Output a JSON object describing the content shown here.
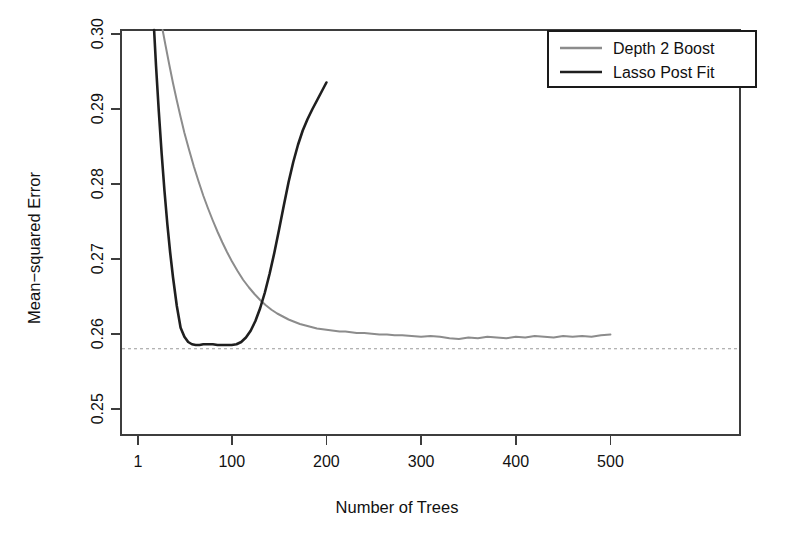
{
  "chart_data": {
    "type": "line",
    "title": "",
    "xlabel": "Number of Trees",
    "ylabel": "Mean−squared Error",
    "xlim": [
      1,
      500
    ],
    "ylim": [
      0.2465,
      0.3005
    ],
    "xticks": [
      1,
      100,
      200,
      300,
      400,
      500
    ],
    "xticklabels": [
      "1",
      "100",
      "200",
      "300",
      "400",
      "500"
    ],
    "yticks": [
      0.25,
      0.26,
      0.27,
      0.28,
      0.29,
      0.3
    ],
    "yticklabels": [
      "0.25",
      "0.26",
      "0.27",
      "0.28",
      "0.29",
      "0.30"
    ],
    "grid": false,
    "legend_position": "top-right",
    "annotations": [
      {
        "name": "reference-line",
        "type": "hline",
        "value": 0.258,
        "style": "dashed",
        "color": "#9a9a9a"
      }
    ],
    "series": [
      {
        "name": "Depth 2 Boost",
        "color": "#8c8c8c",
        "width": 2.0,
        "x": [
          27,
          30,
          34,
          38,
          42,
          46,
          50,
          55,
          60,
          65,
          70,
          75,
          80,
          85,
          90,
          95,
          100,
          106,
          112,
          118,
          124,
          130,
          136,
          142,
          148,
          154,
          160,
          166,
          172,
          178,
          184,
          190,
          196,
          202,
          208,
          214,
          220,
          226,
          232,
          240,
          248,
          256,
          264,
          272,
          280,
          290,
          300,
          310,
          320,
          330,
          340,
          350,
          360,
          370,
          380,
          390,
          400,
          410,
          420,
          430,
          440,
          450,
          460,
          470,
          480,
          490,
          500
        ],
        "y": [
          0.3005,
          0.2985,
          0.2959,
          0.2934,
          0.2911,
          0.2889,
          0.2868,
          0.2845,
          0.2823,
          0.2803,
          0.2784,
          0.2767,
          0.2751,
          0.2736,
          0.2722,
          0.2709,
          0.2697,
          0.2684,
          0.2672,
          0.2662,
          0.2653,
          0.2645,
          0.2638,
          0.2632,
          0.2627,
          0.2623,
          0.2619,
          0.2616,
          0.2613,
          0.2611,
          0.2609,
          0.2607,
          0.2606,
          0.2605,
          0.2604,
          0.2603,
          0.2603,
          0.2602,
          0.2601,
          0.2601,
          0.26,
          0.2599,
          0.2599,
          0.2598,
          0.2598,
          0.2597,
          0.2596,
          0.2597,
          0.2596,
          0.2594,
          0.2593,
          0.2595,
          0.2594,
          0.2596,
          0.2595,
          0.2594,
          0.2596,
          0.2595,
          0.2597,
          0.2596,
          0.2595,
          0.2597,
          0.2596,
          0.2597,
          0.2596,
          0.2598,
          0.2599
        ]
      },
      {
        "name": "Lasso Post Fit",
        "color": "#1f1f1f",
        "width": 2.6,
        "x": [
          18,
          20,
          23,
          26,
          29,
          32,
          35,
          38,
          42,
          46,
          50,
          54,
          58,
          62,
          66,
          70,
          75,
          80,
          85,
          90,
          95,
          100,
          105,
          110,
          115,
          120,
          125,
          130,
          135,
          140,
          145,
          150,
          155,
          160,
          165,
          170,
          175,
          180,
          185,
          190,
          195,
          200
        ],
        "y": [
          0.3005,
          0.2958,
          0.2896,
          0.284,
          0.279,
          0.2746,
          0.2708,
          0.2675,
          0.2637,
          0.2608,
          0.2596,
          0.2589,
          0.2586,
          0.2585,
          0.2585,
          0.2586,
          0.2586,
          0.2586,
          0.2585,
          0.2585,
          0.2585,
          0.2585,
          0.2586,
          0.2589,
          0.2595,
          0.2604,
          0.2617,
          0.2634,
          0.2655,
          0.268,
          0.2708,
          0.2739,
          0.2771,
          0.2802,
          0.2829,
          0.2852,
          0.2871,
          0.2886,
          0.2899,
          0.2911,
          0.2923,
          0.2935
        ]
      }
    ]
  },
  "legend": {
    "items": [
      {
        "label": "Depth 2 Boost",
        "color": "#8c8c8c"
      },
      {
        "label": "Lasso Post Fit",
        "color": "#1f1f1f"
      }
    ]
  },
  "axes": {
    "x_title": "Number of Trees",
    "y_title": "Mean−squared Error"
  }
}
